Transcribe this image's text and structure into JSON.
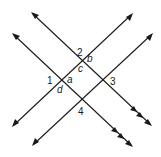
{
  "figure": {
    "lines": [
      {
        "id": "A",
        "from": [
          31,
          12
        ],
        "to": [
          152,
          126
        ],
        "parallel_marks": 2
      },
      {
        "id": "B",
        "from": [
          12,
          33
        ],
        "to": [
          133,
          147
        ],
        "parallel_marks": 2
      },
      {
        "id": "C",
        "from": [
          12,
          127
        ],
        "to": [
          133,
          13
        ],
        "parallel_marks": 0
      },
      {
        "id": "D",
        "from": [
          32,
          146
        ],
        "to": [
          153,
          33
        ],
        "parallel_marks": 0
      }
    ],
    "labels": {
      "angle_1": "1",
      "angle_2": "2",
      "angle_3": "3",
      "angle_4": "4",
      "angle_a": "a",
      "angle_b": "b",
      "angle_c": "c",
      "angle_d": "d"
    },
    "color": "#1a1a1a"
  }
}
